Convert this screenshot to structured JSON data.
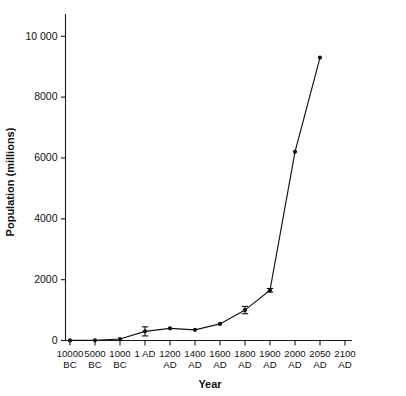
{
  "chart_data": {
    "type": "line",
    "title": "",
    "xlabel": "Year",
    "ylabel": "Population (millions)",
    "categories": [
      "10000 BC",
      "5000 BC",
      "1000 BC",
      "1 AD",
      "1200 AD",
      "1400 AD",
      "1600 AD",
      "1800 AD",
      "1900 AD",
      "2000 AD",
      "2050 AD",
      "2100 AD"
    ],
    "xtick_labels": [
      {
        "num": "10000",
        "era": "BC"
      },
      {
        "num": "5000",
        "era": "BC"
      },
      {
        "num": "1000",
        "era": "BC"
      },
      {
        "num": "1",
        "era": "AD",
        "inline": true
      },
      {
        "num": "1200",
        "era": "AD"
      },
      {
        "num": "1400",
        "era": "AD"
      },
      {
        "num": "1600",
        "era": "AD"
      },
      {
        "num": "1800",
        "era": "AD"
      },
      {
        "num": "1900",
        "era": "AD"
      },
      {
        "num": "2000",
        "era": "AD"
      },
      {
        "num": "2050",
        "era": "AD"
      },
      {
        "num": "2100",
        "era": "AD"
      }
    ],
    "values": [
      4,
      5,
      50,
      300,
      400,
      350,
      545,
      1000,
      1650,
      6200,
      9300,
      null
    ],
    "errors": [
      0,
      0,
      0,
      150,
      0,
      0,
      0,
      120,
      60,
      0,
      0,
      null
    ],
    "ytick_labels": [
      "10 000",
      "8000",
      "6000",
      "4000",
      "2000",
      "0"
    ],
    "ytick_values": [
      10000,
      8000,
      6000,
      4000,
      2000,
      0
    ],
    "ylim": [
      0,
      10600
    ],
    "grid": false,
    "legend": "none",
    "marker": "filled-circle",
    "line_color": "#111111",
    "axis_color": "#1a1a1a",
    "background": "#ffffff"
  }
}
